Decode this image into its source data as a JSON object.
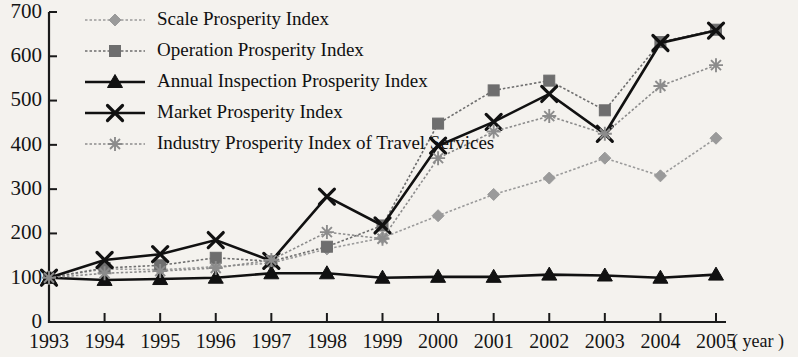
{
  "chart_data": {
    "type": "line",
    "title": "",
    "xlabel": "( year )",
    "ylabel": "",
    "x": [
      1993,
      1994,
      1995,
      1996,
      1997,
      1998,
      1999,
      2000,
      2001,
      2002,
      2003,
      2004,
      2005
    ],
    "categories": [
      "1993",
      "1994",
      "1995",
      "1996",
      "1997",
      "1998",
      "1999",
      "2000",
      "2001",
      "2002",
      "2003",
      "2004",
      "2005"
    ],
    "xlim": [
      1993,
      2005
    ],
    "ylim": [
      0,
      700
    ],
    "yticks": [
      0,
      100,
      200,
      300,
      400,
      500,
      600,
      700
    ],
    "grid": false,
    "legend_position": "top-left",
    "series": [
      {
        "name": "Scale Prosperity Index",
        "marker": "diamond",
        "color": "#9a9a9a",
        "values": [
          100,
          120,
          118,
          125,
          133,
          165,
          190,
          240,
          288,
          325,
          370,
          330,
          415
        ]
      },
      {
        "name": "Operation Prosperity Index",
        "marker": "square",
        "color": "#6e6e6e",
        "values": [
          100,
          122,
          128,
          145,
          137,
          170,
          218,
          448,
          523,
          545,
          478,
          632,
          660
        ]
      },
      {
        "name": "Annual Inspection Prosperity Index",
        "marker": "triangle",
        "color": "#111111",
        "values": [
          100,
          95,
          97,
          100,
          110,
          110,
          100,
          102,
          102,
          107,
          105,
          100,
          107
        ]
      },
      {
        "name": "Market Prosperity Index",
        "marker": "x",
        "color": "#111111",
        "values": [
          100,
          140,
          153,
          185,
          138,
          283,
          218,
          398,
          452,
          515,
          425,
          630,
          658
        ]
      },
      {
        "name": "Industry Prosperity Index of Travel Services",
        "marker": "asterisk",
        "color": "#8c8c8c",
        "values": [
          100,
          110,
          115,
          122,
          140,
          203,
          188,
          370,
          430,
          465,
          425,
          533,
          580
        ]
      }
    ]
  },
  "legend": {
    "items": [
      {
        "label": "Scale Prosperity Index"
      },
      {
        "label": "Operation Prosperity Index"
      },
      {
        "label": "Annual Inspection Prosperity Index"
      },
      {
        "label": "Market Prosperity Index"
      },
      {
        "label": "Industry Prosperity Index of Travel Services"
      }
    ]
  },
  "axes": {
    "y_tick_labels": [
      "700",
      "600",
      "500",
      "400",
      "300",
      "200",
      "100",
      "0"
    ],
    "x_tick_labels": [
      "1993",
      "1994",
      "1995",
      "1996",
      "1997",
      "1998",
      "1999",
      "2000",
      "2001",
      "2002",
      "2003",
      "2004",
      "2005"
    ],
    "x_unit": "( year )"
  }
}
